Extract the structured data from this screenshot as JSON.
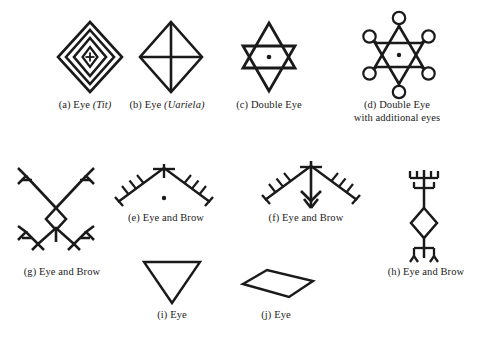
{
  "page": {
    "background_color": "#ffffff",
    "ink_color": "#1a1a1a",
    "width": 488,
    "height": 353
  },
  "figures": [
    {
      "key": "a",
      "symbol_name": "concentric-diamonds-with-cross",
      "caption_prefix": "(a)",
      "caption_main": "Eye",
      "caption_italic": "(Tit)",
      "caption_full": "(a) Eye (Tit)"
    },
    {
      "key": "b",
      "symbol_name": "diamond-with-cross",
      "caption_prefix": "(b)",
      "caption_main": "Eye",
      "caption_italic": "(Uariela)",
      "caption_full": "(b) Eye (Uariela)"
    },
    {
      "key": "c",
      "symbol_name": "hexagram-with-center-dot",
      "caption_prefix": "(c)",
      "caption_main": "Double Eye",
      "caption_italic": "",
      "caption_full": "(c) Double Eye"
    },
    {
      "key": "d",
      "symbol_name": "hexagram-with-looped-points",
      "caption_prefix": "(d)",
      "caption_main": "Double Eye",
      "caption_line2": "with additional eyes",
      "caption_italic": "",
      "caption_full": "(d) Double Eye\nwith additional eyes"
    },
    {
      "key": "e",
      "symbol_name": "chevron-comb-with-cross-and-dot",
      "caption_prefix": "(e)",
      "caption_main": "Eye and Brow",
      "caption_italic": "",
      "caption_full": "(e) Eye and Brow"
    },
    {
      "key": "f",
      "symbol_name": "chevron-comb-with-down-arrow",
      "caption_prefix": "(f)",
      "caption_main": "Eye and Brow",
      "caption_italic": "",
      "caption_full": "(f) Eye and Brow"
    },
    {
      "key": "g",
      "symbol_name": "cross-with-diamond-and-forked-ends",
      "caption_prefix": "(g)",
      "caption_main": "Eye and Brow",
      "caption_italic": "",
      "caption_full": "(g) Eye and Brow"
    },
    {
      "key": "h",
      "symbol_name": "vertical-axis-comb-with-diamond",
      "caption_prefix": "(h)",
      "caption_main": "Eye and Brow",
      "caption_italic": "",
      "caption_full": "(h) Eye and Brow"
    },
    {
      "key": "i",
      "symbol_name": "downward-triangle",
      "caption_prefix": "(i)",
      "caption_main": "Eye",
      "caption_italic": "",
      "caption_full": "(i) Eye"
    },
    {
      "key": "j",
      "symbol_name": "horizontal-rhombus",
      "caption_prefix": "(j)",
      "caption_main": "Eye",
      "caption_italic": "",
      "caption_full": "(j) Eye"
    }
  ]
}
